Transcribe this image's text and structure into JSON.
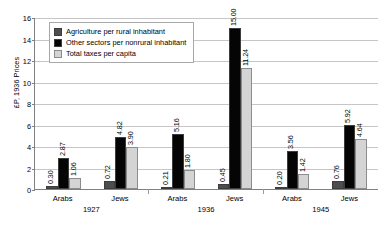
{
  "chart_data": {
    "type": "bar",
    "title": "",
    "xlabel": "",
    "ylabel": "£P, 1936 Prices",
    "ylim": [
      0,
      16
    ],
    "yticks": [
      0,
      2,
      4,
      6,
      8,
      10,
      12,
      14,
      16
    ],
    "grid": true,
    "legend_position": "upper-left-inside",
    "categories": [
      "Arabs",
      "Jews",
      "Arabs",
      "Jews",
      "Arabs",
      "Jews"
    ],
    "groups": [
      {
        "year": "1927",
        "categories": [
          "Arabs",
          "Jews"
        ]
      },
      {
        "year": "1936",
        "categories": [
          "Arabs",
          "Jews"
        ]
      },
      {
        "year": "1945",
        "categories": [
          "Arabs",
          "Jews"
        ]
      }
    ],
    "series": [
      {
        "name": "Agriculture per rural inhabitant",
        "color": "#4d4d4d",
        "values": [
          0.3,
          0.72,
          0.21,
          0.45,
          0.2,
          0.76
        ],
        "labels": [
          "0.30",
          "0.72",
          "0.21",
          "0.45",
          "0.20",
          "0.76"
        ]
      },
      {
        "name": "Other sectors per nonrural inhabitant",
        "color": "#050505",
        "values": [
          2.87,
          4.82,
          5.16,
          15.0,
          3.56,
          5.92
        ],
        "labels": [
          "2.87",
          "4.82",
          "5.16",
          "15.00",
          "3.56",
          "5.92"
        ]
      },
      {
        "name": "Total taxes per capita",
        "color": "#d4d4d4",
        "values": [
          1.06,
          3.9,
          1.8,
          11.24,
          1.42,
          4.64
        ],
        "labels": [
          "1.06",
          "3.90",
          "1.80",
          "11.24",
          "1.42",
          "4.64"
        ]
      }
    ]
  }
}
